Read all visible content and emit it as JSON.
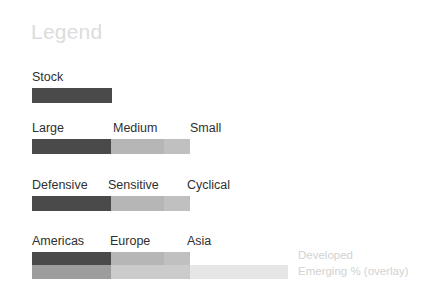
{
  "panel": {
    "title": "Legend",
    "background": "#ffffff",
    "title_color": "#dcdcdc",
    "label_color": "#2f2f2f",
    "note_color": "#d2d2d2"
  },
  "rows": [
    {
      "id": "stock",
      "name": "stock",
      "labels": [
        {
          "text": "Stock",
          "x": 32
        }
      ],
      "bar": {
        "x": 32,
        "width": 80,
        "segments": [
          {
            "name": "stock",
            "width": 80,
            "color": "#4a4a4a"
          }
        ]
      }
    },
    {
      "id": "size",
      "name": "size",
      "labels": [
        {
          "text": "Large",
          "x": 32
        },
        {
          "text": "Medium",
          "x": 113
        },
        {
          "text": "Small",
          "x": 190
        }
      ],
      "bar": {
        "x": 32,
        "width": 158,
        "segments": [
          {
            "name": "large",
            "width": 79,
            "color": "#4a4a4a"
          },
          {
            "name": "medium",
            "width": 53,
            "color": "#b6b6b6"
          },
          {
            "name": "small",
            "width": 26,
            "color": "#c0c0c0"
          }
        ]
      }
    },
    {
      "id": "style",
      "name": "style",
      "labels": [
        {
          "text": "Defensive",
          "x": 32
        },
        {
          "text": "Sensitive",
          "x": 108
        },
        {
          "text": "Cyclical",
          "x": 187
        }
      ],
      "bar": {
        "x": 32,
        "width": 158,
        "segments": [
          {
            "name": "defensive",
            "width": 79,
            "color": "#4a4a4a"
          },
          {
            "name": "sensitive",
            "width": 53,
            "color": "#b6b6b6"
          },
          {
            "name": "cyclical",
            "width": 26,
            "color": "#c0c0c0"
          }
        ]
      }
    },
    {
      "id": "region",
      "name": "region",
      "labels": [
        {
          "text": "Americas",
          "x": 32
        },
        {
          "text": "Europe",
          "x": 110
        },
        {
          "text": "Asia",
          "x": 187
        }
      ],
      "bar": {
        "x": 32,
        "width": 158,
        "segments": [
          {
            "name": "americas",
            "width": 79,
            "color": "#4a4a4a"
          },
          {
            "name": "europe",
            "width": 53,
            "color": "#b6b6b6"
          },
          {
            "name": "asia",
            "width": 26,
            "color": "#c0c0c0"
          }
        ]
      },
      "overlay_bar": {
        "x": 32,
        "width": 256,
        "segments": [
          {
            "name": "americas-emerging",
            "width": 79,
            "color": "#9d9d9d"
          },
          {
            "name": "europe-emerging",
            "width": 79,
            "color": "#cbcbcb"
          },
          {
            "name": "asia-emerging",
            "width": 98,
            "color": "#e6e6e6"
          }
        ]
      }
    }
  ],
  "overlay_notes": [
    {
      "text": "Developed"
    },
    {
      "text": "Emerging % (overlay)"
    }
  ]
}
